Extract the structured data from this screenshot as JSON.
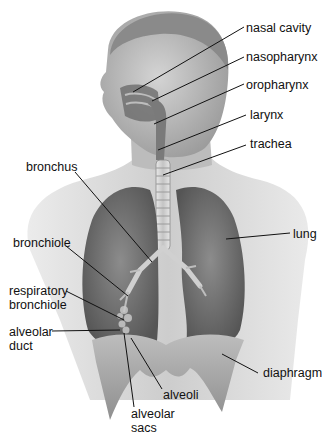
{
  "figure": {
    "labels": {
      "nasal_cavity": "nasal cavity",
      "nasopharynx": "nasopharynx",
      "oropharynx": "oropharynx",
      "larynx": "larynx",
      "trachea": "trachea",
      "bronchus": "bronchus",
      "lung": "lung",
      "bronchiole": "bronchiole",
      "respiratory_bronchiole_1": "respiratory",
      "respiratory_bronchiole_2": "bronchiole",
      "alveolar_duct_1": "alveolar",
      "alveolar_duct_2": "duct",
      "alveoli": "alveoli",
      "alveolar_sacs_1": "alveolar",
      "alveolar_sacs_2": "sacs",
      "diaphragm": "diaphragm"
    },
    "colors": {
      "background": "#ffffff",
      "skin": "#c9c9c9",
      "skin_dark": "#9a9a9a",
      "lung": "#6e6e6e",
      "lung_light": "#8a8a8a",
      "diaphragm": "#a8a8a8",
      "trachea": "#d8d8d8",
      "leader_line": "#111111"
    }
  }
}
